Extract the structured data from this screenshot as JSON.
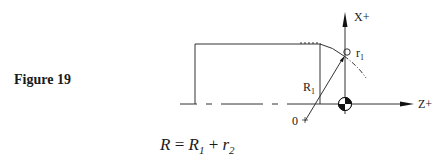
{
  "figure": {
    "label": "Figure 19"
  },
  "diagram": {
    "axes": {
      "x_label": "X+",
      "z_label": "Z+"
    },
    "labels": {
      "tool_nose_radius": "r",
      "tool_nose_radius_sub": "1",
      "arc_radius": "R",
      "arc_radius_sub": "1",
      "arc_center": "0"
    },
    "symbols": [
      "datum-origin-symbol",
      "tool-nose-circle"
    ]
  },
  "formula": {
    "lhs": "R",
    "eq": " = ",
    "term1": "R",
    "term1_sub": "1",
    "plus": " + ",
    "term2": "r",
    "term2_sub": "2"
  }
}
